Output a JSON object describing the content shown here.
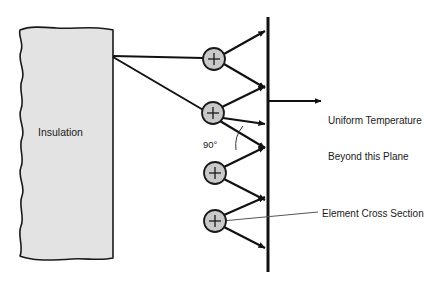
{
  "diagram": {
    "insulation": {
      "label": "Insulation",
      "fill_color": "#e3e3e3",
      "stroke_color": "#1a1a1a"
    },
    "plane": {
      "name": "uniform temperature plane",
      "stroke_color": "#111111",
      "x": 268,
      "y_top": 17,
      "y_bottom": 272
    },
    "angle_annotation": {
      "label": "90°"
    },
    "callouts": {
      "uniform_temperature_line1": "Uniform Temperature",
      "uniform_temperature_line2": "Beyond this Plane",
      "element_cross_section": "Element Cross Section"
    },
    "nodes": [
      {
        "id": "node-1",
        "symbol": "+",
        "cx": 214,
        "cy": 59
      },
      {
        "id": "node-2",
        "symbol": "+",
        "cx": 214,
        "cy": 113
      },
      {
        "id": "node-3",
        "symbol": "+",
        "cx": 215,
        "cy": 173
      },
      {
        "id": "node-4",
        "symbol": "+",
        "cx": 215,
        "cy": 221
      }
    ],
    "node_style": {
      "radius": 11,
      "fill_color": "#c9c9c9",
      "stroke_color": "#1a1a1a"
    },
    "arrow_targets": {
      "node-1": [
        {
          "x": 266,
          "y": 31
        },
        {
          "x": 266,
          "y": 88
        }
      ],
      "node-2": [
        {
          "x": 266,
          "y": 86
        },
        {
          "x": 266,
          "y": 124
        }
      ],
      "node-3": [
        {
          "x": 266,
          "y": 146
        },
        {
          "x": 266,
          "y": 200
        }
      ],
      "node-4": [
        {
          "x": 266,
          "y": 197
        },
        {
          "x": 266,
          "y": 248
        }
      ]
    },
    "feed_lines": [
      {
        "from": {
          "x": 113,
          "y": 56
        },
        "to": {
          "x": 203,
          "y": 59
        }
      },
      {
        "from": {
          "x": 113,
          "y": 57
        },
        "to": {
          "x": 204,
          "y": 112
        }
      }
    ],
    "uniform_temp_arrow": {
      "from": {
        "x": 268,
        "y": 101
      },
      "to": {
        "x": 321,
        "y": 101
      }
    },
    "element_leader_line": {
      "from": {
        "x": 222,
        "y": 221
      },
      "to": {
        "x": 318,
        "y": 212
      }
    }
  }
}
